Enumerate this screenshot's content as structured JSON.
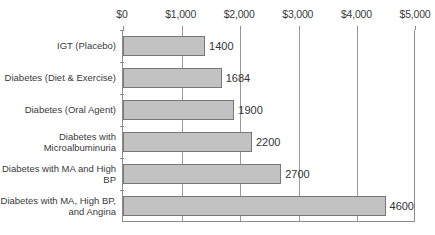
{
  "chart_data": {
    "type": "bar",
    "orientation": "horizontal",
    "title": "",
    "xlabel": "",
    "ylabel": "",
    "xlim": [
      0,
      5000
    ],
    "grid": true,
    "legend": false,
    "axis_position": "top",
    "categories": [
      "IGT (Placebo)",
      "Diabetes (Diet & Exercise)",
      "Diabetes (Oral Agent)",
      "Diabetes with Microalbuminuria",
      "Diabetes with MA and High BP",
      "Diabetes with MA, High BP, and Angina"
    ],
    "values": [
      1400,
      1684,
      1900,
      2200,
      2700,
      4600
    ],
    "value_labels": [
      "1400",
      "1684",
      "1900",
      "2200",
      "2700",
      "4600"
    ],
    "tick_labels": [
      "$0",
      "$1,000",
      "$2,000",
      "$3,000",
      "$4,000",
      "$5,000"
    ],
    "tick_values": [
      0,
      1000,
      2000,
      3000,
      4000,
      5000
    ],
    "colors": {
      "bar_fill": "#c2c2c2",
      "bar_border": "#777777",
      "gridline": "#9a9a9a",
      "axis": "#8c8c8c",
      "text": "#3a3a3a",
      "background": "#ffffff"
    }
  }
}
